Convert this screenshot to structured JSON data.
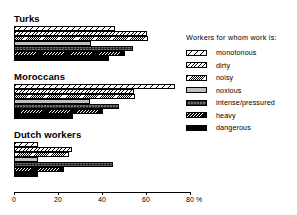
{
  "chart_data": {
    "type": "bar",
    "orientation": "horizontal",
    "title": "",
    "xlabel": "80 %",
    "ylabel": "",
    "xlim": [
      0,
      80
    ],
    "xticks": [
      0,
      20,
      40,
      60,
      80
    ],
    "xtick_labels": [
      "0",
      "20",
      "40",
      "60",
      "80"
    ],
    "unit": "%",
    "grid": false,
    "legend_position": "right",
    "legend_title": "Workers for whom work is:",
    "categories": [
      "Turks",
      "Moroccans",
      "Dutch workers"
    ],
    "series": [
      {
        "name": "monotonous",
        "pattern": "p-monotonous",
        "values": [
          46,
          73,
          11
        ]
      },
      {
        "name": "dirty",
        "pattern": "p-dirty",
        "values": [
          60.5,
          54.5,
          26.5
        ]
      },
      {
        "name": "noisy",
        "pattern": "p-noisy",
        "values": [
          61,
          55,
          25
        ]
      },
      {
        "name": "noxious",
        "pattern": "p-noxious",
        "values": [
          35,
          34.5,
          11
        ]
      },
      {
        "name": "intense/pressured",
        "pattern": "p-intense",
        "values": [
          54,
          47.5,
          45
        ]
      },
      {
        "name": "heavy",
        "pattern": "p-heavy",
        "values": [
          50.5,
          40.5,
          22.5
        ]
      },
      {
        "name": "dangerous",
        "pattern": "p-dangerous",
        "values": [
          43,
          27,
          11
        ]
      }
    ]
  },
  "axis": {
    "unit_suffix": "%"
  }
}
